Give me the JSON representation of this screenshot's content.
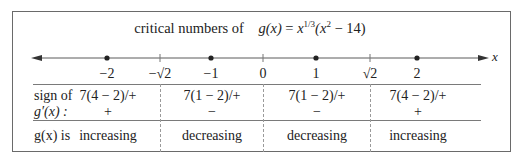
{
  "title": {
    "prefix": "critical numbers of",
    "func_lhs": "g(x)",
    "equals": " = ",
    "base": "x",
    "exponent": "1/3",
    "paren_open": "(x",
    "square": "2",
    "paren_rest": " − 14)"
  },
  "axis": {
    "variable_label": "x",
    "ticks": [
      {
        "label": "−2",
        "x": 107,
        "type": "dot"
      },
      {
        "label": "−√2",
        "x": 160,
        "type": "tick"
      },
      {
        "label": "−1",
        "x": 211,
        "type": "dot"
      },
      {
        "label": "0",
        "x": 263,
        "type": "tick"
      },
      {
        "label": "1",
        "x": 316,
        "type": "dot"
      },
      {
        "label": "√2",
        "x": 370,
        "type": "tick"
      },
      {
        "label": "2",
        "x": 417,
        "type": "dot"
      }
    ]
  },
  "rows": {
    "sign_label_line1": "sign of",
    "sign_label_line2": "g′(x) :",
    "behavior_label": "g(x) is"
  },
  "intervals": [
    {
      "test": "7(4 − 2)/+",
      "sign": "+",
      "behavior": "increasing"
    },
    {
      "test": "7(1 − 2)/+",
      "sign": "−",
      "behavior": "decreasing"
    },
    {
      "test": "7(1 − 2)/+",
      "sign": "−",
      "behavior": "decreasing"
    },
    {
      "test": "7(4 − 2)/+",
      "sign": "+",
      "behavior": "increasing"
    }
  ],
  "colors": {
    "line": "#5a5a5a",
    "dot": "#222222",
    "dashed": "#9a9a9a"
  }
}
